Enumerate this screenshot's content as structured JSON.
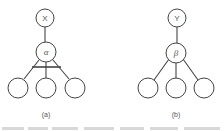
{
  "diagram": {
    "panels": [
      {
        "id": "a",
        "caption": "(a)",
        "root_label": "X",
        "middle_label": "α",
        "children_count": 3,
        "has_crossbar": true
      },
      {
        "id": "b",
        "caption": "(b)",
        "root_label": "Y",
        "middle_label": "β",
        "children_count": 3,
        "has_crossbar": false
      }
    ],
    "cropped_footer_text": "... ... ..."
  },
  "colors": {
    "stroke": "#444444",
    "text": "#555555",
    "background": "#ffffff"
  }
}
